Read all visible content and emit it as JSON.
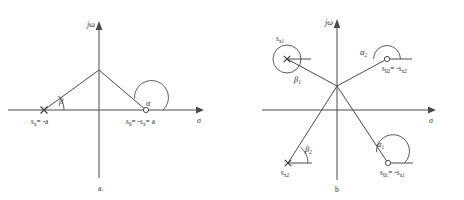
{
  "figure": {
    "type": "complex-plane-pole-zero-diagram",
    "panels": [
      {
        "id": "a",
        "caption": "a.",
        "axes": {
          "imaginary_label": "jω",
          "real_label": "σ"
        },
        "angles": [
          {
            "name": "beta",
            "symbol": "β",
            "subscript": ""
          },
          {
            "name": "alpha",
            "symbol": "α",
            "subscript": ""
          }
        ],
        "markers": [
          {
            "kind": "pole",
            "glyph": "x",
            "label_symbol": "s",
            "label_sub": "x",
            "label_rest": "= -a",
            "label_text": "s x = -a"
          },
          {
            "kind": "zero",
            "glyph": "o",
            "label_symbol": "s",
            "label_sub": "0",
            "label_rest": "= -s x = a",
            "label_text": "s 0 = -s x = a"
          }
        ]
      },
      {
        "id": "b",
        "caption": "b",
        "axes": {
          "imaginary_label": "jω",
          "real_label": "σ"
        },
        "angles": [
          {
            "name": "beta1",
            "symbol": "β",
            "subscript": "1"
          },
          {
            "name": "alpha2",
            "symbol": "α",
            "subscript": "2"
          },
          {
            "name": "beta2",
            "symbol": "β",
            "subscript": "2"
          },
          {
            "name": "alpha1",
            "symbol": "α",
            "subscript": "1"
          }
        ],
        "markers": [
          {
            "kind": "pole",
            "glyph": "x",
            "label_symbol": "s",
            "label_sub": "x1",
            "label_rest": "",
            "label_text": "s x1"
          },
          {
            "kind": "zero",
            "glyph": "o",
            "label_symbol": "s",
            "label_sub": "02",
            "label_rest": "= -s x2",
            "label_text": "s 02 = -s x2"
          },
          {
            "kind": "pole",
            "glyph": "x",
            "label_symbol": "s",
            "label_sub": "x2",
            "label_rest": "",
            "label_text": "s x2"
          },
          {
            "kind": "zero",
            "glyph": "o",
            "label_symbol": "s",
            "label_sub": "01",
            "label_rest": "= -s x1",
            "label_text": "s 01 = -s x1"
          }
        ]
      }
    ],
    "labels": {
      "a_jomega": "jω",
      "a_sigma": "σ",
      "a_beta": "β",
      "a_alpha": "α",
      "a_pole_s": "s",
      "a_pole_sub": "x",
      "a_pole_rest": "= -a",
      "a_zero_s": "s",
      "a_zero_sub": "0",
      "a_zero_mid": "= -s",
      "a_zero_sub2": "x",
      "a_zero_end": "= a",
      "a_caption": "a.",
      "b_jomega": "jω",
      "b_sigma": "σ",
      "b_beta1_sym": "β",
      "b_beta1_sub": "1",
      "b_beta2_sym": "β",
      "b_beta2_sub": "2",
      "b_alpha1_sym": "α",
      "b_alpha1_sub": "1",
      "b_alpha2_sym": "α",
      "b_alpha2_sub": "2",
      "b_sx1_s": "s",
      "b_sx1_sub": "x1",
      "b_sx2_s": "s",
      "b_sx2_sub": "x2",
      "b_s02_s": "s",
      "b_s02_sub": "02",
      "b_s02_mid": "= -s",
      "b_s02_sub2": "x2",
      "b_s01_s": "s",
      "b_s01_sub": "01",
      "b_s01_mid": "= -s",
      "b_s01_sub2": "x1",
      "b_caption": "b"
    },
    "colors": {
      "line": "#4a4a4a",
      "text": "#2b2b2b",
      "background": "#ffffff"
    }
  }
}
